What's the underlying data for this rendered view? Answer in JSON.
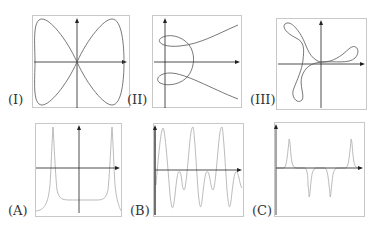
{
  "figure": {
    "panels_top": [
      {
        "id": "I",
        "label": "(I)",
        "type": "parametric-curve",
        "description": "figure-eight / lemniscate-like curve crossing at origin"
      },
      {
        "id": "II",
        "label": "(II)",
        "type": "parametric-curve",
        "description": "two loops near y-axis with branches diverging to the right"
      },
      {
        "id": "III",
        "label": "(III)",
        "type": "parametric-curve",
        "description": "three-lobed curve (trefoil-like) with loops"
      }
    ],
    "panels_bottom": [
      {
        "id": "A",
        "label": "(A)",
        "type": "function-plot",
        "description": "two sharp positive peaks with flat negative baseline between"
      },
      {
        "id": "B",
        "label": "(B)",
        "type": "function-plot",
        "description": "oscillating wave with large and small alternating peaks"
      },
      {
        "id": "C",
        "label": "(C)",
        "type": "function-plot",
        "description": "two positive spikes at ends and two negative spikes in middle"
      }
    ],
    "colors": {
      "curve_top": "#555555",
      "curve_bottom": "#aaaaaa",
      "axis": "#222222",
      "frame": "#c8c8c8"
    }
  }
}
